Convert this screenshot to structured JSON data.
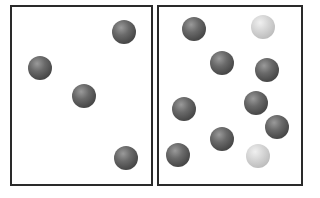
{
  "diagram": {
    "panels": [
      {
        "id": "left",
        "box": {
          "x": 10,
          "y": 5,
          "w": 143,
          "h": 181
        },
        "particles": [
          {
            "x": 124,
            "y": 32,
            "type": "dark"
          },
          {
            "x": 40,
            "y": 68,
            "type": "dark"
          },
          {
            "x": 84,
            "y": 96,
            "type": "dark"
          },
          {
            "x": 126,
            "y": 158,
            "type": "dark"
          }
        ]
      },
      {
        "id": "right",
        "box": {
          "x": 157,
          "y": 5,
          "w": 146,
          "h": 181
        },
        "particles": [
          {
            "x": 194,
            "y": 29,
            "type": "dark"
          },
          {
            "x": 263,
            "y": 27,
            "type": "light"
          },
          {
            "x": 222,
            "y": 63,
            "type": "dark"
          },
          {
            "x": 267,
            "y": 70,
            "type": "dark"
          },
          {
            "x": 184,
            "y": 109,
            "type": "dark"
          },
          {
            "x": 256,
            "y": 103,
            "type": "dark"
          },
          {
            "x": 277,
            "y": 127,
            "type": "dark"
          },
          {
            "x": 222,
            "y": 139,
            "type": "dark"
          },
          {
            "x": 178,
            "y": 155,
            "type": "dark"
          },
          {
            "x": 258,
            "y": 156,
            "type": "light"
          }
        ]
      }
    ],
    "colors": {
      "dark_particle": "#555555",
      "light_particle": "#cfcfcf",
      "border": "#2a2a2a"
    }
  }
}
